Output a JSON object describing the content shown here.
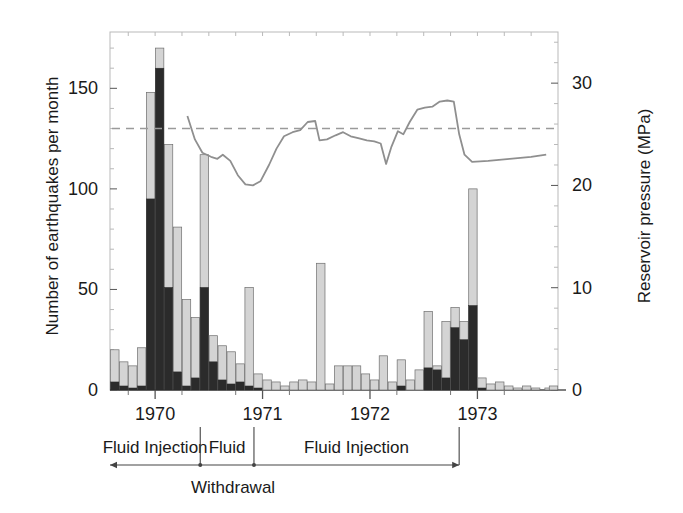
{
  "axes": {
    "left": {
      "title": "Number of earthquakes per month",
      "ticks": [
        0,
        50,
        100,
        150
      ],
      "min": 0,
      "max": 178
    },
    "right": {
      "title": "Reservoir pressure (MPa)",
      "ticks": [
        0,
        10,
        20,
        30
      ],
      "min": 0,
      "max": 35
    },
    "x": {
      "ticks": [
        "1970",
        "1971",
        "1972",
        "1973"
      ],
      "min": 1969.58,
      "max": 1973.75
    }
  },
  "annotations": {
    "segments": [
      {
        "label": "Fluid Injection",
        "start": 1969.58,
        "end": 1970.42
      },
      {
        "label": "Fluid",
        "sublabel": "Withdrawal",
        "start": 1970.42,
        "end": 1970.92
      },
      {
        "label": "Fluid Injection",
        "start": 1970.92,
        "end": 1972.83
      }
    ],
    "withdrawal_label": "Withdrawal"
  },
  "colors": {
    "bar_light": "#d4d4d4",
    "bar_dark": "#2b2b2b",
    "bar_edge": "#6e6e6e",
    "pressure_line": "#8f8f8f",
    "reference_line": "#9a9a9a",
    "frame": "#b9b9b9",
    "axis": "#555555",
    "text": "#1a1a1a"
  },
  "chart_data": {
    "type": "bar",
    "title": "",
    "xlabel": "",
    "ylabel": "Number of earthquakes per month",
    "y2label": "Reservoir pressure (MPa)",
    "ylim": [
      0,
      178
    ],
    "y2lim": [
      0,
      35
    ],
    "xlim": [
      1969.58,
      1973.75
    ],
    "grid": false,
    "legend": "none",
    "bar_width_years": 0.0833,
    "stacked": true,
    "series": [
      {
        "name": "Earthquakes (larger magnitude, dark)",
        "color": "#2b2b2b",
        "values": [
          4,
          2,
          1,
          2,
          95,
          160,
          51,
          9,
          2,
          6,
          51,
          14,
          5,
          3,
          4,
          2,
          1,
          0,
          0,
          0,
          0,
          0,
          0,
          0,
          0,
          0,
          0,
          0,
          0,
          0,
          0,
          0,
          2,
          0,
          0,
          11,
          10,
          6,
          31,
          25,
          42,
          1,
          0,
          0,
          0,
          0,
          0,
          0,
          0,
          0,
          0
        ]
      },
      {
        "name": "Earthquakes (total, light)",
        "color": "#d4d4d4",
        "values": [
          20,
          14,
          12,
          21,
          148,
          170,
          122,
          81,
          45,
          36,
          117,
          27,
          22,
          19,
          13,
          51,
          8,
          5,
          4,
          2,
          4,
          5,
          4,
          63,
          3,
          12,
          12,
          12,
          8,
          5,
          17,
          4,
          15,
          5,
          10,
          39,
          12,
          34,
          41,
          34,
          100,
          6,
          3,
          4,
          2,
          1,
          2,
          1,
          0,
          1,
          2
        ]
      }
    ],
    "x_bar_centers": [
      1969.625,
      1969.708,
      1969.792,
      1969.875,
      1969.958,
      1970.042,
      1970.125,
      1970.208,
      1970.292,
      1970.375,
      1970.458,
      1970.542,
      1970.625,
      1970.708,
      1970.792,
      1970.875,
      1970.958,
      1971.042,
      1971.125,
      1971.208,
      1971.292,
      1971.375,
      1971.458,
      1971.542,
      1971.625,
      1971.708,
      1971.792,
      1971.875,
      1971.958,
      1972.042,
      1972.125,
      1972.208,
      1972.292,
      1972.375,
      1972.458,
      1972.542,
      1972.625,
      1972.708,
      1972.792,
      1972.875,
      1972.958,
      1973.042,
      1973.125,
      1973.208,
      1973.292,
      1973.375,
      1973.458,
      1973.542,
      1973.625,
      1973.667,
      1973.708
    ],
    "pressure_line": {
      "name": "Reservoir pressure",
      "color": "#8f8f8f",
      "unit": "MPa",
      "points": [
        [
          1970.3,
          26.8
        ],
        [
          1970.37,
          24.5
        ],
        [
          1970.44,
          23.2
        ],
        [
          1970.52,
          22.8
        ],
        [
          1970.58,
          22.6
        ],
        [
          1970.63,
          23.0
        ],
        [
          1970.7,
          22.4
        ],
        [
          1970.77,
          21.0
        ],
        [
          1970.84,
          20.1
        ],
        [
          1970.91,
          20.0
        ],
        [
          1970.98,
          20.4
        ],
        [
          1971.06,
          22.0
        ],
        [
          1971.13,
          23.6
        ],
        [
          1971.2,
          24.8
        ],
        [
          1971.28,
          25.2
        ],
        [
          1971.35,
          25.4
        ],
        [
          1971.42,
          26.2
        ],
        [
          1971.49,
          26.3
        ],
        [
          1971.53,
          24.4
        ],
        [
          1971.6,
          24.5
        ],
        [
          1971.68,
          24.9
        ],
        [
          1971.75,
          25.2
        ],
        [
          1971.82,
          24.8
        ],
        [
          1971.9,
          24.6
        ],
        [
          1971.97,
          24.4
        ],
        [
          1972.04,
          24.3
        ],
        [
          1972.1,
          24.1
        ],
        [
          1972.15,
          22.1
        ],
        [
          1972.2,
          23.8
        ],
        [
          1972.26,
          25.3
        ],
        [
          1972.31,
          25.0
        ],
        [
          1972.37,
          26.2
        ],
        [
          1972.44,
          27.4
        ],
        [
          1972.51,
          27.6
        ],
        [
          1972.58,
          27.7
        ],
        [
          1972.65,
          28.2
        ],
        [
          1972.72,
          28.3
        ],
        [
          1972.78,
          28.2
        ],
        [
          1972.83,
          25.0
        ],
        [
          1972.88,
          23.0
        ],
        [
          1972.95,
          22.3
        ],
        [
          1973.1,
          22.4
        ],
        [
          1973.3,
          22.6
        ],
        [
          1973.5,
          22.8
        ],
        [
          1973.64,
          23.0
        ]
      ]
    },
    "reference_line": {
      "name": "Reference pressure level",
      "value_left_axis": 130,
      "value_mpa": 25.6,
      "style": "dashed",
      "color": "#9a9a9a"
    }
  }
}
